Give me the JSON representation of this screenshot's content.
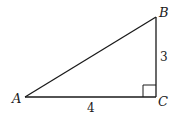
{
  "figure": {
    "type": "right-triangle",
    "vertices": [
      {
        "id": "A",
        "label": "A"
      },
      {
        "id": "B",
        "label": "B"
      },
      {
        "id": "C",
        "label": "C"
      }
    ],
    "sides": {
      "AC": {
        "label": "4"
      },
      "BC": {
        "label": "3"
      },
      "AB": {
        "label": ""
      }
    },
    "right_angle_at": "C",
    "colors": {
      "stroke": "#1a1a1a",
      "background": "#ffffff"
    }
  }
}
